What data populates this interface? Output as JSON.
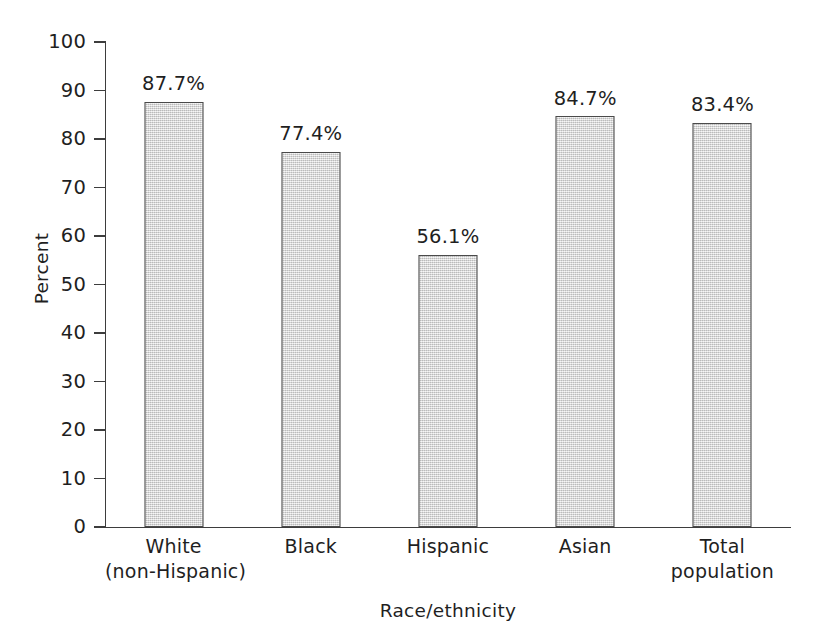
{
  "chart_data": {
    "type": "bar",
    "title": "",
    "subtitle": "",
    "xlabel": "Race/ethnicity",
    "ylabel": "Percent",
    "categories": [
      "White\n(non-Hispanic)",
      "Black",
      "Hispanic",
      "Asian",
      "Total\npopulation"
    ],
    "category_lines": [
      [
        "White",
        "(non-Hispanic)"
      ],
      [
        "Black"
      ],
      [
        "Hispanic"
      ],
      [
        "Asian"
      ],
      [
        "Total",
        "population"
      ]
    ],
    "values": [
      87.7,
      77.4,
      56.1,
      84.7,
      83.4
    ],
    "data_labels": [
      "87.7%",
      "77.4%",
      "56.1%",
      "84.7%",
      "83.4%"
    ],
    "ylim": [
      0,
      100
    ],
    "ytick_values": [
      0,
      10,
      20,
      30,
      40,
      50,
      60,
      70,
      80,
      90,
      100
    ],
    "ytick_labels": [
      "0",
      "10",
      "20",
      "30",
      "40",
      "50",
      "60",
      "70",
      "80",
      "90",
      "100"
    ],
    "ytick_step": 10,
    "grid": false,
    "legend": null,
    "legend_position": "none",
    "bar_fill_color": "#d9d9d9",
    "bar_border_color": "#4a4a4a",
    "axis_color": "#3d3d3d",
    "text_color": "#1f1f1f",
    "background_color": "#ffffff"
  }
}
